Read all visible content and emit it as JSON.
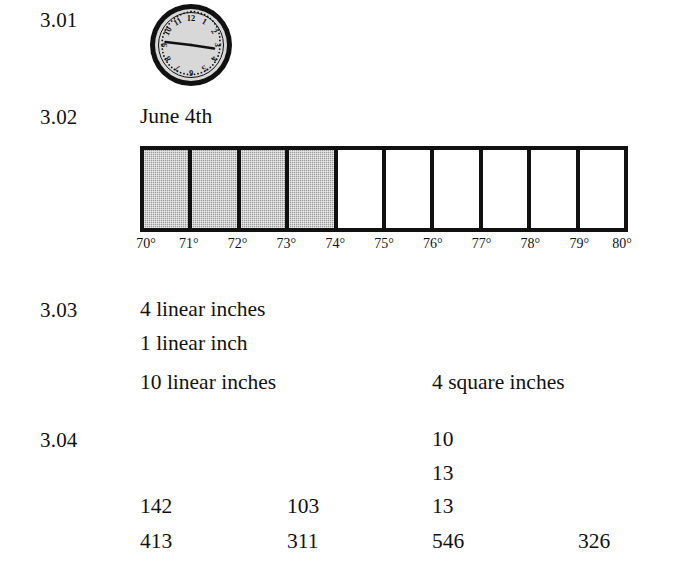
{
  "page": {
    "sections": [
      "3.01",
      "3.02",
      "3.03",
      "3.04"
    ]
  },
  "items": {
    "q301": {
      "number": "3.01",
      "answer_type": "clock-illustration",
      "clock": {
        "hour_numerals": [
          "12",
          "1",
          "2",
          "3",
          "4",
          "5",
          "6",
          "7",
          "8",
          "9",
          "10",
          "11"
        ],
        "hour_hand_points_to": "3",
        "minute_hand_points_to": "9",
        "time_shown": "2:45"
      }
    },
    "q302": {
      "number": "3.02",
      "date_answer": "June 4th",
      "scale_labels": [
        "70°",
        "71°",
        "72°",
        "73°",
        "74°",
        "75°",
        "76°",
        "77°",
        "78°",
        "79°",
        "80°"
      ]
    },
    "q303": {
      "number": "3.03",
      "lines": [
        {
          "left": "4 linear inches",
          "right": ""
        },
        {
          "left": "1 linear inch",
          "right": ""
        },
        {
          "left": "10 linear inches",
          "right": "4 square inches"
        }
      ]
    },
    "q304": {
      "number": "3.04",
      "rows": [
        {
          "a": "",
          "b": "",
          "c": "10",
          "d": ""
        },
        {
          "a": "",
          "b": "",
          "c": "13",
          "d": ""
        },
        {
          "a": "142",
          "b": "103",
          "c": "13",
          "d": ""
        },
        {
          "a": "413",
          "b": "311",
          "c": "546",
          "d": "326"
        }
      ]
    }
  },
  "chart_data": {
    "type": "bar",
    "title": "June 4th",
    "orientation": "horizontal-segmented-thermometer",
    "categories": [
      "70°-71°",
      "71°-72°",
      "72°-73°",
      "73°-74°",
      "74°-75°",
      "75°-76°",
      "76°-77°",
      "77°-78°",
      "78°-79°",
      "79°-80°"
    ],
    "values": [
      1,
      1,
      1,
      1,
      0,
      0,
      0,
      0,
      0,
      0
    ],
    "filled_count": 4,
    "total_cells": 10,
    "tick_labels": [
      "70°",
      "71°",
      "72°",
      "73°",
      "74°",
      "75°",
      "76°",
      "77°",
      "78°",
      "79°",
      "80°"
    ],
    "xlabel": "",
    "ylabel": "",
    "xlim": [
      70,
      80
    ],
    "grid": false,
    "legend": "none",
    "fill_color": "#9a9a9a",
    "empty_color": "#ffffff",
    "border_color": "#111111",
    "reading": "74°"
  }
}
